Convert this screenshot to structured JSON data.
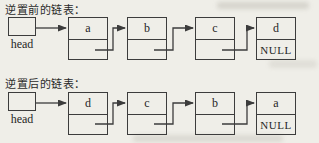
{
  "colors": {
    "background": "#efeee8",
    "line": "#3c3c3c",
    "text": "#262626"
  },
  "rows": [
    {
      "title": "逆置前的链表：",
      "head_label": "head",
      "nodes": [
        {
          "data": "a",
          "pointer": ""
        },
        {
          "data": "b",
          "pointer": ""
        },
        {
          "data": "c",
          "pointer": ""
        },
        {
          "data": "d",
          "pointer": "NULL"
        }
      ]
    },
    {
      "title": "逆置后的链表：",
      "head_label": "head",
      "nodes": [
        {
          "data": "d",
          "pointer": ""
        },
        {
          "data": "c",
          "pointer": ""
        },
        {
          "data": "b",
          "pointer": ""
        },
        {
          "data": "a",
          "pointer": "NULL"
        }
      ]
    }
  ]
}
